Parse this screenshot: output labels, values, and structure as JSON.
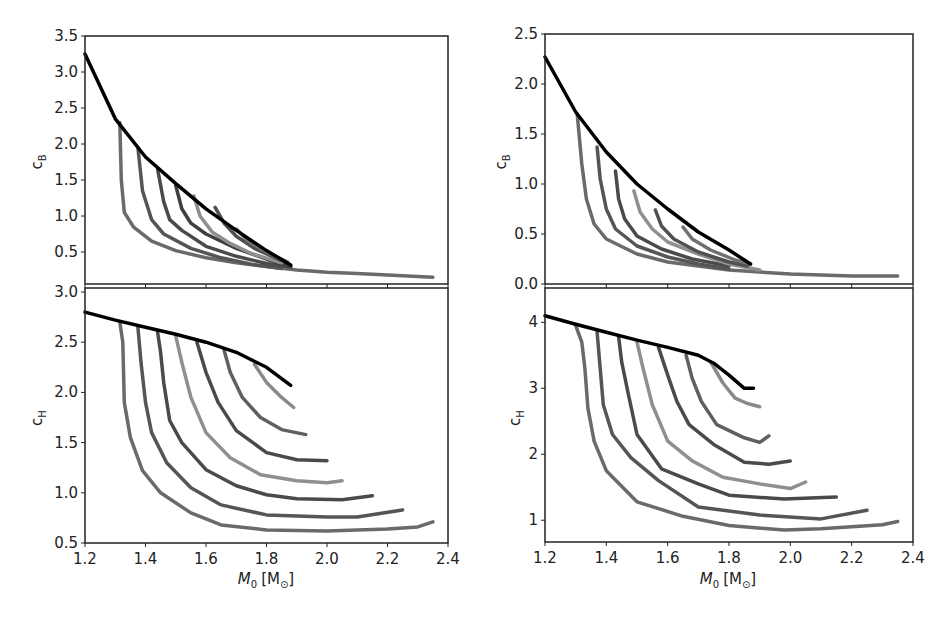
{
  "chart_data": [
    {
      "id": "top-left",
      "type": "line",
      "title": "",
      "xlabel": "",
      "ylabel": "c_B",
      "xlim": [
        1.2,
        2.4
      ],
      "ylim": [
        0.056,
        3.5
      ],
      "yticks": [
        "0.5",
        "1.0",
        "1.5",
        "2.0",
        "2.5",
        "3.0",
        "3.5"
      ],
      "ytick_values": [
        0.5,
        1.0,
        1.5,
        2.0,
        2.5,
        3.0,
        3.5
      ],
      "xticks_values": [
        1.2,
        1.4,
        1.6,
        1.8,
        2.0,
        2.2,
        2.4
      ],
      "grid": false,
      "series": [
        {
          "name": "envelope",
          "color": "#000000",
          "x": [
            1.2,
            1.3,
            1.4,
            1.5,
            1.6,
            1.7,
            1.8,
            1.88
          ],
          "y": [
            3.25,
            2.35,
            1.82,
            1.45,
            1.1,
            0.8,
            0.52,
            0.32
          ]
        },
        {
          "name": "track-1",
          "color": "#6a6a6a",
          "x": [
            1.315,
            1.32,
            1.33,
            1.36,
            1.42,
            1.5,
            1.6,
            1.7,
            1.8,
            1.9,
            2.0,
            2.1,
            2.2,
            2.3,
            2.35
          ],
          "y": [
            2.3,
            1.5,
            1.05,
            0.85,
            0.65,
            0.52,
            0.42,
            0.35,
            0.3,
            0.25,
            0.22,
            0.2,
            0.18,
            0.16,
            0.15
          ]
        },
        {
          "name": "track-2",
          "color": "#555555",
          "x": [
            1.375,
            1.39,
            1.42,
            1.46,
            1.55,
            1.65,
            1.75,
            1.85
          ],
          "y": [
            1.95,
            1.35,
            0.95,
            0.75,
            0.55,
            0.42,
            0.33,
            0.27
          ]
        },
        {
          "name": "track-3",
          "color": "#4a4a4a",
          "x": [
            1.44,
            1.46,
            1.48,
            1.52,
            1.6,
            1.7,
            1.8,
            1.88
          ],
          "y": [
            1.65,
            1.2,
            0.95,
            0.8,
            0.58,
            0.44,
            0.34,
            0.29
          ]
        },
        {
          "name": "track-4",
          "color": "#3f3f3f",
          "x": [
            1.5,
            1.52,
            1.55,
            1.6,
            1.7,
            1.8,
            1.88
          ],
          "y": [
            1.42,
            1.1,
            0.9,
            0.75,
            0.55,
            0.4,
            0.3
          ]
        },
        {
          "name": "track-5",
          "color": "#8f8f8f",
          "x": [
            1.56,
            1.58,
            1.62,
            1.68,
            1.75,
            1.85
          ],
          "y": [
            1.28,
            1.0,
            0.78,
            0.62,
            0.48,
            0.35
          ]
        },
        {
          "name": "track-6",
          "color": "#505050",
          "x": [
            1.63,
            1.66,
            1.7,
            1.76,
            1.85
          ],
          "y": [
            1.12,
            0.9,
            0.72,
            0.55,
            0.38
          ]
        },
        {
          "name": "track-7",
          "color": "#707070",
          "x": [
            1.7,
            1.74,
            1.8,
            1.87
          ],
          "y": [
            0.82,
            0.65,
            0.5,
            0.36
          ]
        }
      ]
    },
    {
      "id": "bottom-left",
      "type": "line",
      "xlabel": "M_0 [M_sun]",
      "ylabel": "c_H",
      "xlim": [
        1.2,
        2.4
      ],
      "ylim": [
        0.5,
        3.04
      ],
      "yticks": [
        "0.5",
        "1.0",
        "1.5",
        "2.0",
        "2.5",
        "3.0"
      ],
      "ytick_values": [
        0.5,
        1.0,
        1.5,
        2.0,
        2.5,
        3.0
      ],
      "xticks": [
        "1.2",
        "1.4",
        "1.6",
        "1.8",
        "2.0",
        "2.2",
        "2.4"
      ],
      "xtick_values": [
        1.2,
        1.4,
        1.6,
        1.8,
        2.0,
        2.2,
        2.4
      ],
      "grid": false,
      "series": [
        {
          "name": "envelope",
          "color": "#000000",
          "x": [
            1.2,
            1.3,
            1.4,
            1.5,
            1.6,
            1.7,
            1.8,
            1.88
          ],
          "y": [
            2.8,
            2.72,
            2.65,
            2.58,
            2.5,
            2.4,
            2.25,
            2.07
          ]
        },
        {
          "name": "track-1",
          "color": "#6a6a6a",
          "x": [
            1.315,
            1.325,
            1.33,
            1.35,
            1.39,
            1.45,
            1.55,
            1.65,
            1.8,
            2.0,
            2.2,
            2.3,
            2.35
          ],
          "y": [
            2.7,
            2.5,
            1.9,
            1.55,
            1.22,
            1.0,
            0.8,
            0.68,
            0.63,
            0.62,
            0.64,
            0.66,
            0.71
          ]
        },
        {
          "name": "track-2",
          "color": "#555555",
          "x": [
            1.375,
            1.385,
            1.4,
            1.42,
            1.47,
            1.55,
            1.65,
            1.8,
            2.0,
            2.1,
            2.25
          ],
          "y": [
            2.65,
            2.3,
            1.9,
            1.6,
            1.3,
            1.05,
            0.88,
            0.78,
            0.76,
            0.76,
            0.83
          ]
        },
        {
          "name": "track-3",
          "color": "#4a4a4a",
          "x": [
            1.44,
            1.45,
            1.46,
            1.48,
            1.52,
            1.6,
            1.7,
            1.8,
            1.9,
            2.05,
            2.15
          ],
          "y": [
            2.6,
            2.4,
            2.1,
            1.72,
            1.5,
            1.23,
            1.07,
            0.98,
            0.94,
            0.93,
            0.97
          ]
        },
        {
          "name": "track-4",
          "color": "#8f8f8f",
          "x": [
            1.5,
            1.52,
            1.55,
            1.6,
            1.68,
            1.78,
            1.9,
            2.0,
            2.05
          ],
          "y": [
            2.56,
            2.3,
            1.95,
            1.6,
            1.35,
            1.18,
            1.12,
            1.1,
            1.12
          ]
        },
        {
          "name": "track-5",
          "color": "#4a4a4a",
          "x": [
            1.57,
            1.6,
            1.64,
            1.7,
            1.8,
            1.9,
            2.0
          ],
          "y": [
            2.5,
            2.2,
            1.9,
            1.62,
            1.4,
            1.33,
            1.32
          ]
        },
        {
          "name": "track-6",
          "color": "#606060",
          "x": [
            1.66,
            1.68,
            1.72,
            1.78,
            1.85,
            1.93
          ],
          "y": [
            2.42,
            2.2,
            1.95,
            1.75,
            1.63,
            1.58
          ]
        },
        {
          "name": "track-7",
          "color": "#8a8a8a",
          "x": [
            1.76,
            1.8,
            1.85,
            1.89
          ],
          "y": [
            2.28,
            2.1,
            1.95,
            1.85
          ]
        }
      ]
    },
    {
      "id": "top-right",
      "type": "line",
      "xlabel": "",
      "ylabel": "c_B",
      "xlim": [
        1.2,
        2.4
      ],
      "ylim": [
        0.0,
        2.5
      ],
      "yticks": [
        "0.0",
        "0.5",
        "1.0",
        "1.5",
        "2.0",
        "2.5"
      ],
      "ytick_values": [
        0.0,
        0.5,
        1.0,
        1.5,
        2.0,
        2.5
      ],
      "grid": false,
      "series": [
        {
          "name": "envelope",
          "color": "#000000",
          "x": [
            1.2,
            1.3,
            1.4,
            1.5,
            1.6,
            1.7,
            1.8,
            1.87
          ],
          "y": [
            2.27,
            1.72,
            1.32,
            1.0,
            0.75,
            0.52,
            0.34,
            0.2
          ]
        },
        {
          "name": "track-1",
          "color": "#6a6a6a",
          "x": [
            1.305,
            1.32,
            1.335,
            1.36,
            1.4,
            1.5,
            1.6,
            1.7,
            1.8,
            1.9,
            2.0,
            2.1,
            2.2,
            2.35
          ],
          "y": [
            1.7,
            1.2,
            0.85,
            0.6,
            0.45,
            0.3,
            0.22,
            0.18,
            0.14,
            0.12,
            0.1,
            0.09,
            0.08,
            0.08
          ]
        },
        {
          "name": "track-2",
          "color": "#555555",
          "x": [
            1.37,
            1.38,
            1.4,
            1.43,
            1.5,
            1.6,
            1.7,
            1.8
          ],
          "y": [
            1.37,
            1.05,
            0.75,
            0.55,
            0.38,
            0.27,
            0.2,
            0.15
          ]
        },
        {
          "name": "track-3",
          "color": "#4a4a4a",
          "x": [
            1.43,
            1.44,
            1.46,
            1.5,
            1.58,
            1.68,
            1.8
          ],
          "y": [
            1.13,
            0.85,
            0.65,
            0.48,
            0.35,
            0.25,
            0.18
          ]
        },
        {
          "name": "track-4",
          "color": "#8f8f8f",
          "x": [
            1.49,
            1.51,
            1.55,
            1.6,
            1.7,
            1.8,
            1.9
          ],
          "y": [
            0.93,
            0.72,
            0.55,
            0.42,
            0.3,
            0.2,
            0.14
          ]
        },
        {
          "name": "track-5",
          "color": "#505050",
          "x": [
            1.56,
            1.58,
            1.62,
            1.7,
            1.8,
            1.86
          ],
          "y": [
            0.74,
            0.58,
            0.45,
            0.32,
            0.22,
            0.18
          ]
        },
        {
          "name": "track-6",
          "color": "#707070",
          "x": [
            1.65,
            1.68,
            1.74,
            1.82,
            1.87
          ],
          "y": [
            0.57,
            0.45,
            0.34,
            0.24,
            0.2
          ]
        }
      ]
    },
    {
      "id": "bottom-right",
      "type": "line",
      "xlabel": "M_0 [M_sun]",
      "ylabel": "c_H",
      "xlim": [
        1.2,
        2.4
      ],
      "ylim": [
        0.67,
        4.52
      ],
      "yticks": [
        "1",
        "2",
        "3",
        "4"
      ],
      "ytick_values": [
        1,
        2,
        3,
        4
      ],
      "xticks": [
        "1.2",
        "1.4",
        "1.6",
        "1.8",
        "2.0",
        "2.2",
        "2.4"
      ],
      "xtick_values": [
        1.2,
        1.4,
        1.6,
        1.8,
        2.0,
        2.2,
        2.4
      ],
      "grid": false,
      "series": [
        {
          "name": "envelope",
          "color": "#000000",
          "x": [
            1.2,
            1.3,
            1.4,
            1.5,
            1.6,
            1.7,
            1.75,
            1.8,
            1.85,
            1.88
          ],
          "y": [
            4.1,
            3.97,
            3.85,
            3.73,
            3.62,
            3.5,
            3.38,
            3.2,
            3.0,
            3.0
          ]
        },
        {
          "name": "track-1",
          "color": "#6a6a6a",
          "x": [
            1.3,
            1.32,
            1.33,
            1.34,
            1.36,
            1.4,
            1.5,
            1.65,
            1.8,
            1.98,
            2.1,
            2.3,
            2.35
          ],
          "y": [
            3.95,
            3.7,
            3.3,
            2.7,
            2.2,
            1.75,
            1.28,
            1.06,
            0.92,
            0.85,
            0.87,
            0.93,
            0.98
          ]
        },
        {
          "name": "track-2",
          "color": "#555555",
          "x": [
            1.37,
            1.38,
            1.39,
            1.42,
            1.48,
            1.57,
            1.7,
            1.9,
            2.1,
            2.25
          ],
          "y": [
            3.85,
            3.3,
            2.75,
            2.3,
            1.95,
            1.6,
            1.2,
            1.08,
            1.02,
            1.15
          ]
        },
        {
          "name": "track-3",
          "color": "#4a4a4a",
          "x": [
            1.44,
            1.45,
            1.47,
            1.5,
            1.58,
            1.7,
            1.8,
            1.98,
            2.15
          ],
          "y": [
            3.78,
            3.4,
            2.95,
            2.3,
            1.78,
            1.55,
            1.38,
            1.32,
            1.35
          ]
        },
        {
          "name": "track-4",
          "color": "#8f8f8f",
          "x": [
            1.5,
            1.52,
            1.55,
            1.6,
            1.68,
            1.78,
            1.9,
            2.0,
            2.05
          ],
          "y": [
            3.7,
            3.3,
            2.75,
            2.2,
            1.9,
            1.65,
            1.55,
            1.48,
            1.58
          ]
        },
        {
          "name": "track-5",
          "color": "#4a4a4a",
          "x": [
            1.57,
            1.6,
            1.63,
            1.67,
            1.75,
            1.85,
            1.93,
            2.0
          ],
          "y": [
            3.62,
            3.2,
            2.8,
            2.45,
            2.15,
            1.88,
            1.85,
            1.9
          ]
        },
        {
          "name": "track-6",
          "color": "#606060",
          "x": [
            1.66,
            1.68,
            1.71,
            1.76,
            1.85,
            1.9,
            1.93
          ],
          "y": [
            3.5,
            3.15,
            2.8,
            2.45,
            2.25,
            2.18,
            2.28
          ]
        },
        {
          "name": "track-7",
          "color": "#8a8a8a",
          "x": [
            1.74,
            1.78,
            1.82,
            1.86,
            1.9
          ],
          "y": [
            3.4,
            3.08,
            2.85,
            2.77,
            2.72
          ]
        }
      ]
    }
  ],
  "panels": {
    "top_left": {
      "ylabel_main": "c",
      "ylabel_sub": "B"
    },
    "bottom_left": {
      "ylabel_main": "c",
      "ylabel_sub": "H",
      "xlabel_main": "M",
      "xlabel_sub": "0",
      "xlabel_unit": "[M",
      "xlabel_unit_sym": "⊙",
      "xlabel_close": "]"
    },
    "top_right": {
      "ylabel_main": "c",
      "ylabel_sub": "B"
    },
    "bottom_right": {
      "ylabel_main": "c",
      "ylabel_sub": "H",
      "xlabel_main": "M",
      "xlabel_sub": "0",
      "xlabel_unit": "[M",
      "xlabel_unit_sym": "⊙",
      "xlabel_close": "]"
    }
  }
}
